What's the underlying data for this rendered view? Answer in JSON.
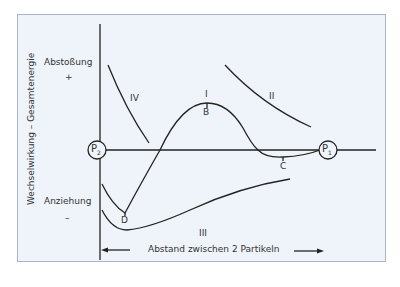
{
  "diagram": {
    "y_axis_label": "Wechselwirkung – Gesamtenergie",
    "repulsion_label": "Abstoßung",
    "repulsion_sign": "+",
    "attraction_label": "Anziehung",
    "attraction_sign": "–",
    "x_axis_label": "Abstand zwischen 2 Partikeln",
    "particles": [
      {
        "label": "P",
        "sub": "2"
      },
      {
        "label": "P",
        "sub": "1"
      }
    ],
    "curve_labels": {
      "I": "I",
      "II": "II",
      "III": "III",
      "IV": "IV"
    },
    "point_labels": {
      "B": "B",
      "C": "C",
      "D": "D"
    },
    "colors": {
      "background": "#eef4fa",
      "frame_border": "#aab4c2",
      "line": "#222222"
    }
  }
}
